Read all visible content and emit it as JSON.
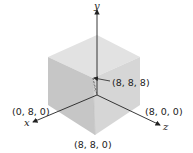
{
  "figure": {
    "type": "3d-cube-coordinate-diagram",
    "colors": {
      "top_face": "#e2e2e2",
      "left_face": "#c6c6c6",
      "right_face": "#d6d6d6",
      "axis": "#222222",
      "text": "#222222"
    },
    "axes": {
      "x_label": "x",
      "y_label": "y",
      "z_label": "z"
    },
    "vertex_labels": {
      "top_corner": "(8, 8, 8)",
      "left": "(0, 8, 0)",
      "right": "(8, 0, 0)",
      "bottom": "(8, 8, 0)"
    }
  }
}
